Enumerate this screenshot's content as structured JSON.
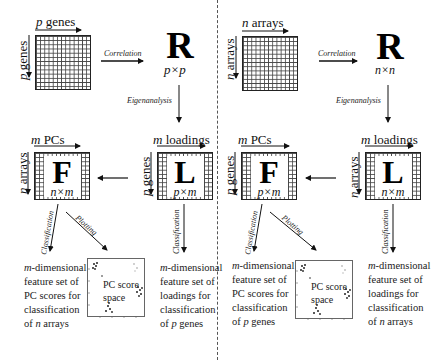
{
  "left_panel": {
    "data_matrix": {
      "top_label_var": "p",
      "top_label_text": " genes",
      "side_label_var": "p",
      "side_label_text": " genes"
    },
    "correlation_label": "Correlation",
    "R_matrix": {
      "letter": "R",
      "dim": "p×p"
    },
    "eigen_label": "Eigenanalysis",
    "F_matrix": {
      "letter": "F",
      "dim": "n×m",
      "top_label_var": "m",
      "top_label_text": " PCs",
      "side_label_var": "n",
      "side_label_text": " arrays"
    },
    "L_matrix": {
      "letter": "L",
      "dim": "p×m",
      "top_label_var": "m",
      "top_label_text": " loadings",
      "side_label_var": "p",
      "side_label_text": " genes"
    },
    "classification_label_F": "Classification",
    "plotting_label": "Plotting",
    "classification_label_L": "Classification",
    "F_result": {
      "var": "m",
      "line1": "-dimensional",
      "line2": "feature set of",
      "line3": "PC scores for",
      "line4": "classification",
      "line5_prefix": "of ",
      "line5_var": "n",
      "line5_suffix": " arrays"
    },
    "scatter": {
      "label_line1": "PC score",
      "label_line2": "space"
    },
    "L_result": {
      "var": "m",
      "line1": "-dimensional",
      "line2": "feature set of",
      "line3": "loadings for",
      "line4": "classification",
      "line5_prefix": "of ",
      "line5_var": "p",
      "line5_suffix": " genes"
    }
  },
  "right_panel": {
    "data_matrix": {
      "top_label_var": "n",
      "top_label_text": " arrays",
      "side_label_var": "n",
      "side_label_text": " arrays"
    },
    "correlation_label": "Correlation",
    "R_matrix": {
      "letter": "R",
      "dim": "n×n"
    },
    "eigen_label": "Eigenanalysis",
    "F_matrix": {
      "letter": "F",
      "dim": "p×m",
      "top_label_var": "m",
      "top_label_text": " PCs",
      "side_label_var": "p",
      "side_label_text": " genes"
    },
    "L_matrix": {
      "letter": "L",
      "dim": "n×m",
      "top_label_var": "m",
      "top_label_text": " loadings",
      "side_label_var": "n",
      "side_label_text": " arrays"
    },
    "classification_label_F": "Classification",
    "plotting_label": "Plotting",
    "classification_label_L": "Classification",
    "F_result": {
      "var": "m",
      "line1": "-dimensional",
      "line2": "feature set of",
      "line3": "PC scores for",
      "line4": "classification",
      "line5_prefix": "of ",
      "line5_var": "p",
      "line5_suffix": " genes"
    },
    "scatter": {
      "label_line1": "PC score",
      "label_line2": "space"
    },
    "L_result": {
      "var": "m",
      "line1": "-dimensional",
      "line2": "feature set of",
      "line3": "loadings for",
      "line4": "classification",
      "line5_prefix": "of ",
      "line5_var": "n",
      "line5_suffix": " arrays"
    }
  },
  "colors": {
    "ink": "#111111",
    "grid": "#444444",
    "divider": "#555555",
    "background": "#ffffff"
  }
}
